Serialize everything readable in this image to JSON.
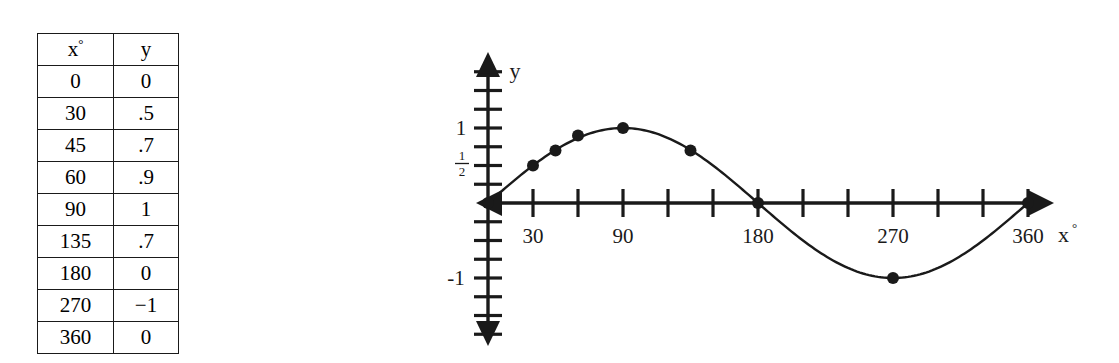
{
  "figure": {
    "name": "sine-function-table-and-graph"
  },
  "table": {
    "headers": [
      "x",
      "y"
    ],
    "header_x_degree_symbol": "°",
    "rows": [
      {
        "x": "0",
        "y": "0"
      },
      {
        "x": "30",
        "y": ".5"
      },
      {
        "x": "45",
        "y": ".7"
      },
      {
        "x": "60",
        "y": ".9"
      },
      {
        "x": "90",
        "y": "1"
      },
      {
        "x": "135",
        "y": ".7"
      },
      {
        "x": "180",
        "y": "0"
      },
      {
        "x": "270",
        "y": "−1"
      },
      {
        "x": "360",
        "y": "0"
      }
    ]
  },
  "graph": {
    "y_axis_label": "y",
    "x_axis_label": "x",
    "x_axis_label_degree_symbol": "°",
    "y_tick_labels": [
      {
        "value": 1,
        "text": "1"
      },
      {
        "value": -1,
        "text": "-1"
      }
    ],
    "y_fraction_label": {
      "numerator": "1",
      "denominator": "2",
      "value": 0.5
    },
    "x_tick_labels": [
      {
        "value": 30,
        "text": "30"
      },
      {
        "value": 90,
        "text": "90"
      },
      {
        "value": 180,
        "text": "180"
      },
      {
        "value": 270,
        "text": "270"
      },
      {
        "value": 360,
        "text": "360"
      }
    ],
    "colors": {
      "ink": "#1a1a1a",
      "background": "#ffffff"
    }
  },
  "chart_data": {
    "type": "line",
    "title": "",
    "subtitle": "",
    "xlabel": "x°",
    "ylabel": "y",
    "grid": false,
    "legend": "none",
    "xlim": [
      -210,
      390
    ],
    "ylim": [
      -1.9,
      1.9
    ],
    "x_tick_interval_degrees": 30,
    "y_tick_interval": 0.25,
    "x": [
      0,
      30,
      45,
      60,
      90,
      135,
      180,
      270,
      360
    ],
    "y": [
      0,
      0.5,
      0.7,
      0.9,
      1,
      0.7,
      0,
      -1,
      0
    ],
    "series": [
      {
        "name": "y = sin x",
        "points": [
          {
            "x": 0,
            "y": 0
          },
          {
            "x": 30,
            "y": 0.5
          },
          {
            "x": 45,
            "y": 0.7
          },
          {
            "x": 60,
            "y": 0.9
          },
          {
            "x": 90,
            "y": 1
          },
          {
            "x": 135,
            "y": 0.7
          },
          {
            "x": 180,
            "y": 0
          },
          {
            "x": 270,
            "y": -1
          },
          {
            "x": 360,
            "y": 0
          }
        ]
      }
    ],
    "annotations": []
  }
}
